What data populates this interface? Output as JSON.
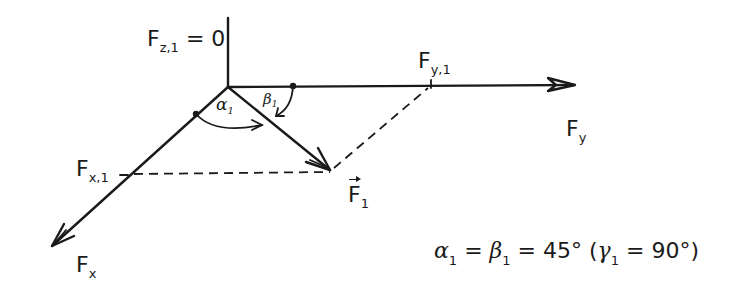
{
  "diagram": {
    "type": "force-component-diagram",
    "axes": {
      "z": {
        "label": "F",
        "subscript": "z,1",
        "suffix": " = 0"
      },
      "y": {
        "label": "F",
        "subscript": "y"
      },
      "x": {
        "label": "F",
        "subscript": "x"
      }
    },
    "components": {
      "fy1": {
        "label": "F",
        "subscript": "y,1"
      },
      "fx1": {
        "label": "F",
        "subscript": "x,1"
      }
    },
    "vector": {
      "label": "F",
      "subscript": "1",
      "has_vector_arrow": true
    },
    "angles": {
      "alpha": {
        "symbol": "α",
        "subscript": "1"
      },
      "beta": {
        "symbol": "β",
        "subscript": "1"
      }
    },
    "equation": {
      "alpha": "α",
      "alpha_sub": "1",
      "eq1": " = ",
      "beta": "β",
      "beta_sub": "1",
      "eq2": " = 45°  (",
      "gamma": "γ",
      "gamma_sub": "1",
      "eq3": " = 90°)"
    },
    "stroke_color": "#1a1a1a",
    "background": "#ffffff"
  }
}
